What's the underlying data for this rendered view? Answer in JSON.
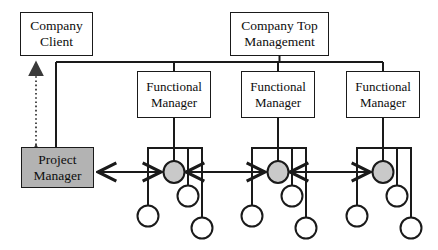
{
  "diagram": {
    "canvas": {
      "width": 438,
      "height": 250,
      "background": "#ffffff"
    },
    "colors": {
      "line": "#1a1a1a",
      "box_border": "#1a1a1a",
      "box_fill": "#ffffff",
      "highlight_fill": "#b3b3b3",
      "node_fill": "#c9c9c9",
      "node_empty_fill": "#ffffff",
      "dotted_line": "#4d4d4d"
    },
    "nodes": [
      {
        "id": "company-client",
        "label": "Company\nClient",
        "shape": "rect",
        "fill": "#ffffff",
        "x": 20,
        "y": 12,
        "w": 73,
        "h": 44
      },
      {
        "id": "company-top-management",
        "label": "Company Top\nManagement",
        "shape": "rect",
        "fill": "#ffffff",
        "x": 230,
        "y": 12,
        "w": 99,
        "h": 44
      },
      {
        "id": "functional-manager-1",
        "label": "Functional\nManager",
        "shape": "rect",
        "fill": "#ffffff",
        "x": 137,
        "y": 71,
        "w": 74,
        "h": 47
      },
      {
        "id": "functional-manager-2",
        "label": "Functional\nManager",
        "shape": "rect",
        "fill": "#ffffff",
        "x": 241,
        "y": 71,
        "w": 74,
        "h": 47
      },
      {
        "id": "functional-manager-3",
        "label": "Functional\nManager",
        "shape": "rect",
        "fill": "#ffffff",
        "x": 346,
        "y": 71,
        "w": 74,
        "h": 47
      },
      {
        "id": "project-manager",
        "label": "Project\nManager",
        "shape": "rect",
        "fill": "#b3b3b3",
        "x": 21,
        "y": 147,
        "w": 73,
        "h": 41
      }
    ],
    "staff_groups": [
      {
        "group": 1,
        "bar_y": 148,
        "bar_x1": 148,
        "bar_x2": 202,
        "stem_x": 174,
        "members": [
          {
            "id": "g1-m1",
            "cx": 148,
            "cy": 216,
            "r": 11,
            "fill": "#ffffff",
            "assigned": false
          },
          {
            "id": "g1-m2",
            "cx": 174,
            "cy": 172,
            "r": 11,
            "fill": "#c9c9c9",
            "assigned": true
          },
          {
            "id": "g1-m3",
            "cx": 188,
            "cy": 196,
            "r": 11,
            "fill": "#ffffff",
            "assigned": false
          },
          {
            "id": "g1-m4",
            "cx": 202,
            "cy": 228,
            "r": 11,
            "fill": "#ffffff",
            "assigned": false
          }
        ]
      },
      {
        "group": 2,
        "bar_y": 148,
        "bar_x1": 252,
        "bar_x2": 306,
        "stem_x": 278,
        "members": [
          {
            "id": "g2-m1",
            "cx": 252,
            "cy": 216,
            "r": 11,
            "fill": "#ffffff",
            "assigned": false
          },
          {
            "id": "g2-m2",
            "cx": 278,
            "cy": 172,
            "r": 11,
            "fill": "#c9c9c9",
            "assigned": true
          },
          {
            "id": "g2-m3",
            "cx": 292,
            "cy": 196,
            "r": 11,
            "fill": "#ffffff",
            "assigned": false
          },
          {
            "id": "g2-m4",
            "cx": 306,
            "cy": 228,
            "r": 11,
            "fill": "#ffffff",
            "assigned": false
          }
        ]
      },
      {
        "group": 3,
        "bar_y": 148,
        "bar_x1": 357,
        "bar_x2": 411,
        "stem_x": 383,
        "members": [
          {
            "id": "g3-m1",
            "cx": 357,
            "cy": 216,
            "r": 11,
            "fill": "#ffffff",
            "assigned": false
          },
          {
            "id": "g3-m2",
            "cx": 383,
            "cy": 172,
            "r": 11,
            "fill": "#c9c9c9",
            "assigned": true
          },
          {
            "id": "g3-m3",
            "cx": 397,
            "cy": 196,
            "r": 11,
            "fill": "#ffffff",
            "assigned": false
          },
          {
            "id": "g3-m4",
            "cx": 411,
            "cy": 228,
            "r": 11,
            "fill": "#ffffff",
            "assigned": false
          }
        ]
      }
    ],
    "connectors": [
      {
        "id": "client-to-project-manager",
        "style": "dotted",
        "arrows": "both",
        "from": "project-manager",
        "to": "company-client"
      },
      {
        "id": "top-management-to-client-bus",
        "style": "solid",
        "arrows": "none",
        "from": "company-top-management",
        "to": "company-client"
      },
      {
        "id": "top-management-to-functional-1",
        "style": "solid",
        "arrows": "none",
        "from": "company-top-management",
        "to": "functional-manager-1"
      },
      {
        "id": "top-management-to-functional-2",
        "style": "solid",
        "arrows": "none",
        "from": "company-top-management",
        "to": "functional-manager-2"
      },
      {
        "id": "top-management-to-functional-3",
        "style": "solid",
        "arrows": "none",
        "from": "company-top-management",
        "to": "functional-manager-3"
      },
      {
        "id": "functional-1-to-staff-bar",
        "style": "solid",
        "arrows": "none",
        "from": "functional-manager-1",
        "to": "g1-m2"
      },
      {
        "id": "functional-2-to-staff-bar",
        "style": "solid",
        "arrows": "none",
        "from": "functional-manager-2",
        "to": "g2-m2"
      },
      {
        "id": "functional-3-to-staff-bar",
        "style": "solid",
        "arrows": "none",
        "from": "functional-manager-3",
        "to": "g3-m2"
      },
      {
        "id": "project-manager-to-g1",
        "style": "solid",
        "arrows": "both",
        "from": "project-manager",
        "to": "g1-m2"
      },
      {
        "id": "g1-to-g2",
        "style": "solid",
        "arrows": "both",
        "from": "g1-m2",
        "to": "g2-m2"
      },
      {
        "id": "g2-to-g3",
        "style": "solid",
        "arrows": "both",
        "from": "g2-m2",
        "to": "g3-m2"
      },
      {
        "id": "project-manager-vertical-bus",
        "style": "solid",
        "arrows": "none",
        "from": "company-client-bus",
        "to": "project-manager"
      }
    ]
  }
}
